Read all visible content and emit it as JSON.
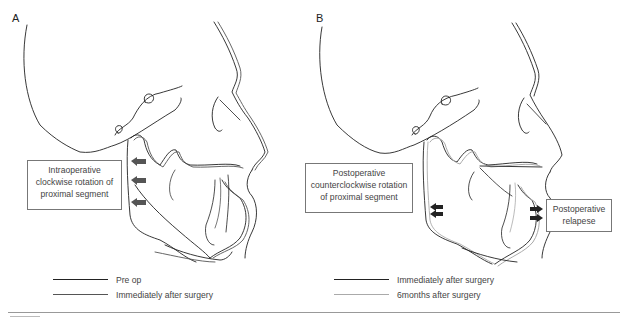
{
  "figure": {
    "panels": [
      {
        "id": "A",
        "letter": "A",
        "callout": {
          "lines": [
            "Intraoperative",
            "clockwise rotation of",
            "proximal segment"
          ]
        },
        "legend": [
          {
            "label": "Pre op",
            "color": "#222222"
          },
          {
            "label": "Immediately after surgery",
            "color": "#555555"
          }
        ],
        "arrows": 3,
        "arrow_color": "#555555"
      },
      {
        "id": "B",
        "letter": "B",
        "callout": {
          "lines": [
            "Postoperative",
            "counterclockwise rotation",
            "of proximal segment"
          ]
        },
        "callout2": {
          "lines": [
            "Postoperative",
            "relapese"
          ]
        },
        "legend": [
          {
            "label": "Immediately after surgery",
            "color": "#222222"
          },
          {
            "label": "6months after surgery",
            "color": "#aaaaaa"
          }
        ],
        "arrows": 4,
        "arrow_color": "#222222"
      }
    ],
    "colors": {
      "line_dark": "#222222",
      "line_mid": "#555555",
      "line_light": "#aaaaaa",
      "callout_border": "#777777"
    }
  }
}
